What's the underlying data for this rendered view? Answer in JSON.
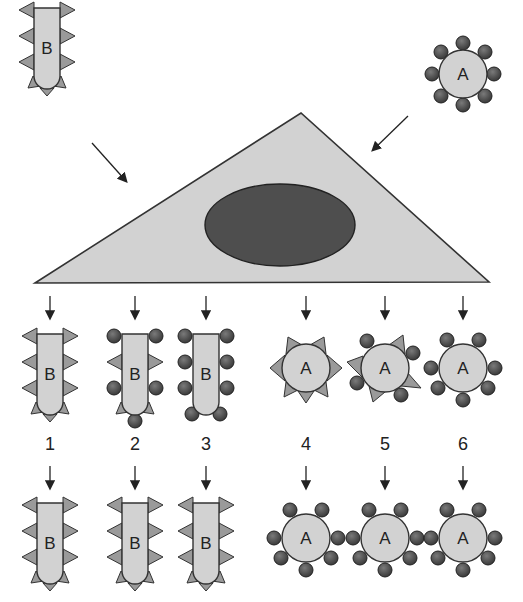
{
  "figure": {
    "source_cell_b": {
      "label": "B"
    },
    "source_cell_a": {
      "label": "A"
    },
    "colors": {
      "cell_fill": "#d2d2d2",
      "outline": "#333333",
      "spike_fill": "#9a9a9a",
      "ball_fill": "#4a4a4a",
      "nucleus_fill": "#4e4e4e",
      "arrow": "#222222"
    },
    "outcomes": [
      {
        "number": "1",
        "cell": "B",
        "top_markers": "spikes",
        "bottom_markers": "spikes"
      },
      {
        "number": "2",
        "cell": "B",
        "top_markers": "mixed balls and spikes",
        "bottom_markers": "spikes"
      },
      {
        "number": "3",
        "cell": "B",
        "top_markers": "balls",
        "bottom_markers": "spikes"
      },
      {
        "number": "4",
        "cell": "A",
        "top_markers": "spikes",
        "bottom_markers": "balls"
      },
      {
        "number": "5",
        "cell": "A",
        "top_markers": "mixed balls and spikes",
        "bottom_markers": "balls"
      },
      {
        "number": "6",
        "cell": "A",
        "top_markers": "balls",
        "bottom_markers": "balls"
      }
    ],
    "top_row_letters": [
      "B",
      "B",
      "B",
      "A",
      "A",
      "A"
    ],
    "bottom_row_letters": [
      "B",
      "B",
      "B",
      "A",
      "A",
      "A"
    ]
  }
}
